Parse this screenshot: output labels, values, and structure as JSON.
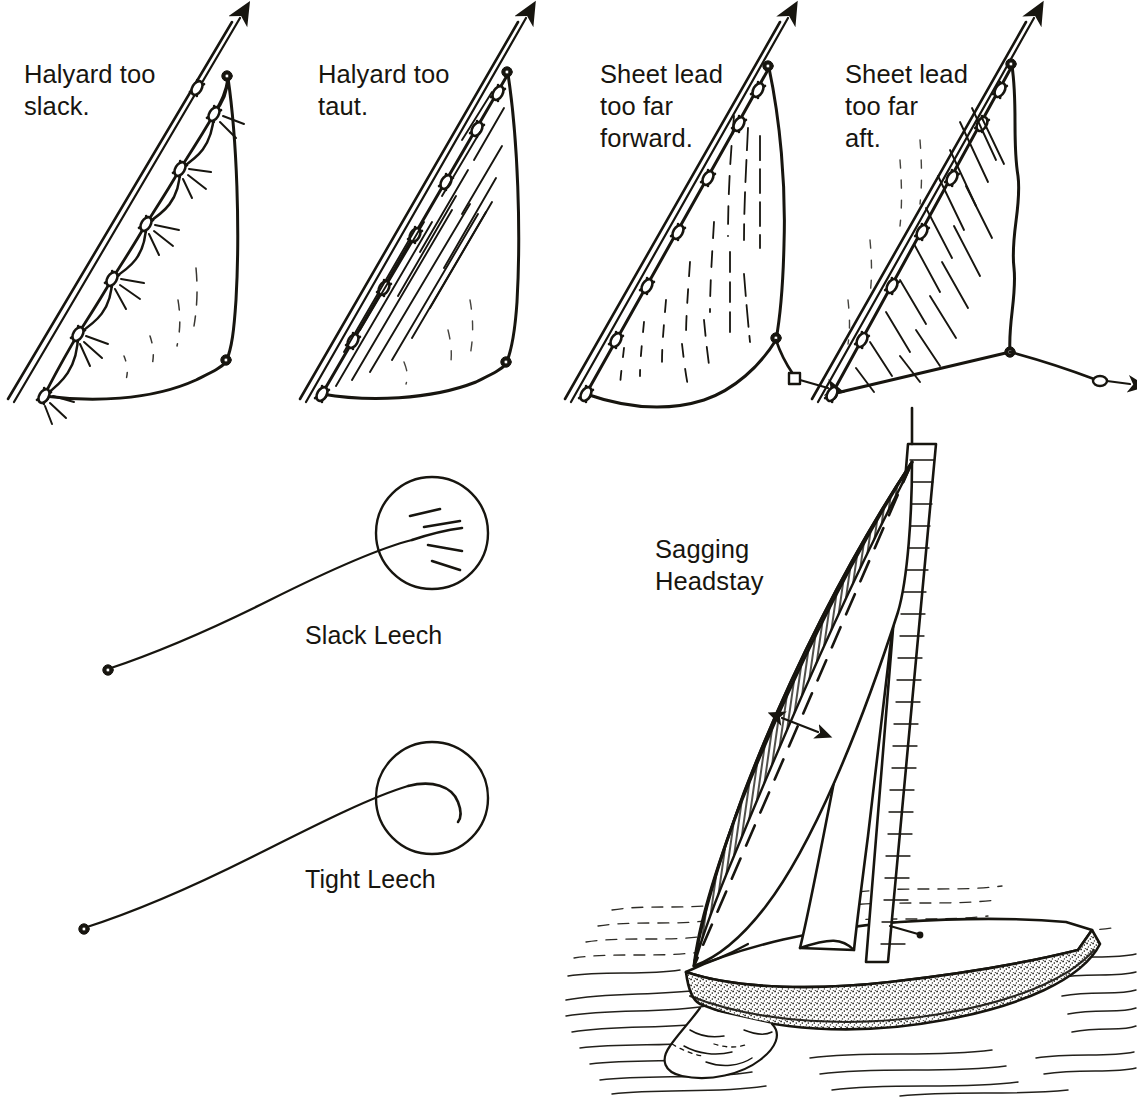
{
  "page": {
    "title": "Genoa Trim",
    "width": 1137,
    "height": 1107,
    "ink_color": "#17150f",
    "paper_color": "#ffffff",
    "style": "pen-and-ink line drawing"
  },
  "top_row": {
    "panels": [
      {
        "id": "halyard-too-slack",
        "label": "Halyard too\nslack.",
        "label_x": 24,
        "label_y": 58,
        "fault": "halyard tension too loose",
        "symptom": "scalloped luff sagging between hanks with radiating wrinkles",
        "hank_count": 7
      },
      {
        "id": "halyard-too-taut",
        "label": "Halyard too\ntaut.",
        "label_x": 318,
        "label_y": 58,
        "fault": "halyard tension too tight",
        "symptom": "vertical wrinkles running up the luff",
        "hank_count": 7
      },
      {
        "id": "sheet-lead-too-far-forward",
        "label": "Sheet lead\ntoo far\nforward.",
        "label_x": 600,
        "label_y": 58,
        "fault": "sheet lead positioned too far forward",
        "symptom": "foot stretched tight, leech closed, clew pulled down",
        "hank_count": 7,
        "sheet_direction": "down and aft to block"
      },
      {
        "id": "sheet-lead-too-far-aft",
        "label": "Sheet lead\ntoo far\naft.",
        "label_x": 845,
        "label_y": 58,
        "fault": "sheet lead positioned too far aft",
        "symptom": "leech open and twisted, creases from clew",
        "hank_count": 7,
        "sheet_direction": "horizontal aft to block"
      }
    ]
  },
  "leech_row": {
    "items": [
      {
        "id": "slack-leech",
        "label": "Slack Leech",
        "label_x": 305,
        "label_y": 620,
        "detail": "leech trailing edge flutters open with airflow separation lines",
        "circle_cx": 432,
        "circle_cy": 533,
        "circle_r": 56
      },
      {
        "id": "tight-leech",
        "label": "Tight Leech",
        "label_x": 305,
        "label_y": 864,
        "detail": "leech trailing edge hooks back to windward",
        "circle_cx": 432,
        "circle_cy": 798,
        "circle_r": 56
      }
    ]
  },
  "boat": {
    "label": "Sagging\nHeadstay",
    "label_x": 655,
    "label_y": 533,
    "description": "sloop heeled under sail with headstay bowed to leeward",
    "annotations": {
      "dashed_line": "straight headstay reference",
      "arrow": "double headed arrow indicating amount of sag"
    },
    "parts": [
      "mast",
      "headsail",
      "mainsail",
      "headstay",
      "hull",
      "water",
      "bow wave"
    ]
  },
  "icons": {
    "arrow_head": "arrowhead-icon",
    "hank": "sail-hank-icon",
    "grommet": "grommet-icon",
    "block": "sheet-block-icon"
  }
}
